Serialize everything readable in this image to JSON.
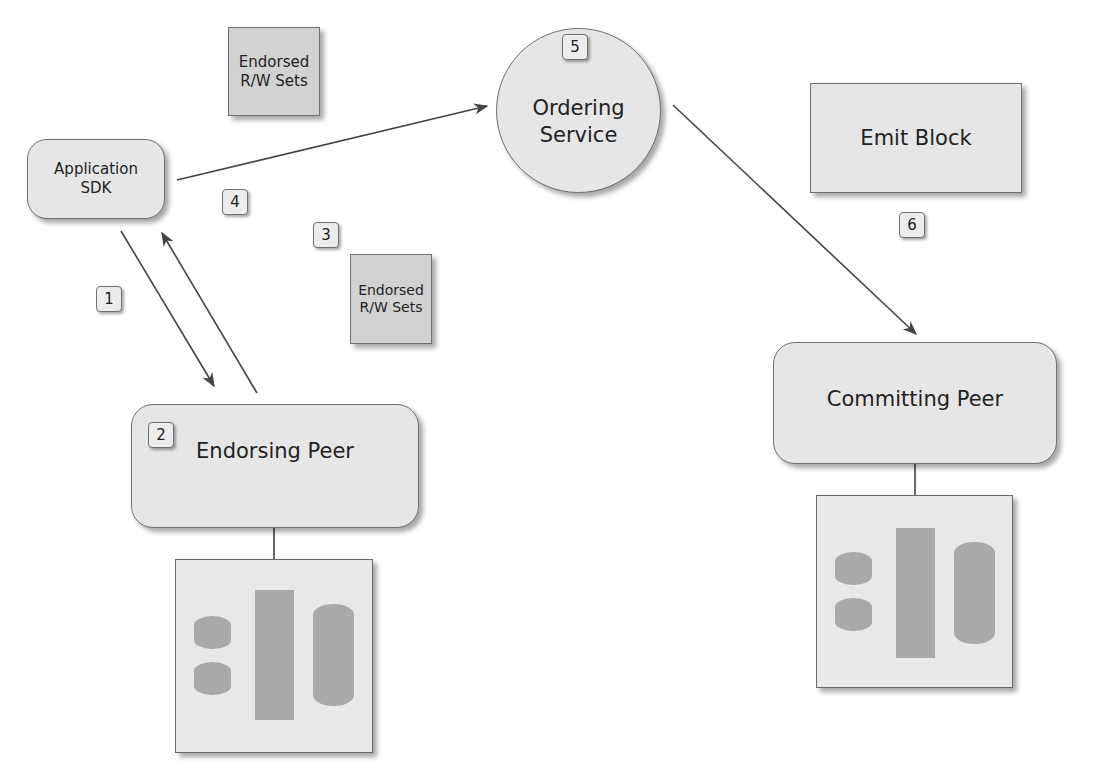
{
  "diagram": {
    "nodes": {
      "application_sdk": {
        "label_line1": "Application",
        "label_line2": "SDK"
      },
      "ordering_service": {
        "label_line1": "Ordering",
        "label_line2": "Service",
        "step": "5"
      },
      "emit_block": {
        "label": "Emit Block"
      },
      "endorsing_peer": {
        "label": "Endorsing Peer",
        "step": "2"
      },
      "committing_peer": {
        "label": "Committing Peer"
      },
      "endorsed_sets_top": {
        "label_line1": "Endorsed",
        "label_line2": "R/W Sets"
      },
      "endorsed_sets_mid": {
        "label_line1": "Endorsed",
        "label_line2": "R/W Sets"
      }
    },
    "steps": {
      "s1": "1",
      "s3": "3",
      "s4": "4",
      "s6": "6"
    },
    "edges": [
      {
        "from": "application_sdk",
        "to": "endorsing_peer",
        "step": "1"
      },
      {
        "from": "endorsing_peer",
        "to": "application_sdk",
        "step": "3"
      },
      {
        "from": "application_sdk",
        "to": "ordering_service",
        "step": "4"
      },
      {
        "from": "ordering_service",
        "to": "committing_peer",
        "step": "6"
      }
    ],
    "colors": {
      "node_fill": "#e6e6e6",
      "node_border": "#707070",
      "storage_glyph": "#a9a9a9",
      "edge": "#444444"
    }
  }
}
